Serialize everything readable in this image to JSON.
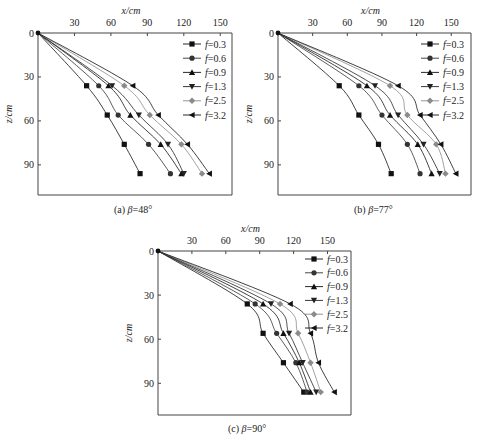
{
  "figure": {
    "panels": [
      {
        "id": "a",
        "caption_prefix": "(a) ",
        "caption_symbol": "β",
        "caption_value": "=48°"
      },
      {
        "id": "b",
        "caption_prefix": "(b) ",
        "caption_symbol": "β",
        "caption_value": "=77°"
      },
      {
        "id": "c",
        "caption_prefix": "(c) ",
        "caption_symbol": "β",
        "caption_value": "=90°"
      }
    ]
  },
  "chart_data": [
    {
      "type": "line",
      "title": "(a) β=48°",
      "xlabel": "x/cm",
      "ylabel": "z/cm",
      "x_ticks": [
        30,
        60,
        90,
        120,
        150
      ],
      "y_ticks": [
        0,
        30,
        60,
        90
      ],
      "xlim": [
        0,
        160
      ],
      "ylim": [
        110,
        0
      ],
      "y_inverted": true,
      "x_axis_position": "top",
      "grid": false,
      "legend_position": "upper right",
      "z": [
        0,
        36,
        56,
        76,
        96
      ],
      "series": [
        {
          "name": "f=0.3",
          "marker": "square",
          "color": "#111111",
          "x": [
            0,
            40,
            57,
            71,
            84
          ]
        },
        {
          "name": "f=0.6",
          "marker": "circle",
          "color": "#333333",
          "x": [
            0,
            50,
            66,
            91,
            109
          ]
        },
        {
          "name": "f=0.9",
          "marker": "triangle-up",
          "color": "#111111",
          "x": [
            0,
            58,
            76,
            101,
            118
          ]
        },
        {
          "name": "f=1.3",
          "marker": "triangle-down",
          "color": "#222222",
          "x": [
            0,
            61,
            83,
            107,
            120
          ]
        },
        {
          "name": "f=2.5",
          "marker": "diamond",
          "color": "#8a8a8a",
          "x": [
            0,
            71,
            92,
            118,
            135
          ]
        },
        {
          "name": "f=3.2",
          "marker": "triangle-left",
          "color": "#111111",
          "x": [
            0,
            78,
            99,
            123,
            141
          ]
        }
      ]
    },
    {
      "type": "line",
      "title": "(b) β=77°",
      "xlabel": "x/cm",
      "ylabel": "z/cm",
      "x_ticks": [
        30,
        60,
        90,
        120,
        150
      ],
      "y_ticks": [
        0,
        30,
        60,
        90
      ],
      "xlim": [
        0,
        168
      ],
      "ylim": [
        110,
        0
      ],
      "y_inverted": true,
      "x_axis_position": "top",
      "grid": false,
      "legend_position": "upper right",
      "z": [
        0,
        36,
        56,
        76,
        96
      ],
      "series": [
        {
          "name": "f=0.3",
          "marker": "square",
          "color": "#111111",
          "x": [
            0,
            53,
            70,
            87,
            98
          ]
        },
        {
          "name": "f=0.6",
          "marker": "circle",
          "color": "#333333",
          "x": [
            0,
            70,
            90,
            112,
            123
          ]
        },
        {
          "name": "f=0.9",
          "marker": "triangle-up",
          "color": "#111111",
          "x": [
            0,
            77,
            97,
            121,
            133
          ]
        },
        {
          "name": "f=1.3",
          "marker": "triangle-down",
          "color": "#222222",
          "x": [
            0,
            84,
            104,
            126,
            140
          ]
        },
        {
          "name": "f=2.5",
          "marker": "diamond",
          "color": "#8a8a8a",
          "x": [
            0,
            97,
            112,
            137,
            145
          ]
        },
        {
          "name": "f=3.2",
          "marker": "triangle-left",
          "color": "#111111",
          "x": [
            0,
            104,
            123,
            141,
            154
          ]
        }
      ]
    },
    {
      "type": "line",
      "title": "(c) β=90°",
      "xlabel": "x/cm",
      "ylabel": "z/cm",
      "x_ticks": [
        30,
        60,
        90,
        120,
        150
      ],
      "y_ticks": [
        0,
        30,
        60,
        90
      ],
      "xlim": [
        0,
        170
      ],
      "ylim": [
        110,
        0
      ],
      "y_inverted": true,
      "x_axis_position": "top",
      "grid": false,
      "legend_position": "upper right",
      "z": [
        0,
        36,
        56,
        76,
        96
      ],
      "series": [
        {
          "name": "f=0.3",
          "marker": "square",
          "color": "#111111",
          "x": [
            0,
            79,
            93,
            111,
            129
          ]
        },
        {
          "name": "f=0.6",
          "marker": "circle",
          "color": "#333333",
          "x": [
            0,
            86,
            105,
            122,
            132
          ]
        },
        {
          "name": "f=0.9",
          "marker": "triangle-up",
          "color": "#111111",
          "x": [
            0,
            93,
            111,
            125,
            135
          ]
        },
        {
          "name": "f=1.3",
          "marker": "triangle-down",
          "color": "#222222",
          "x": [
            0,
            100,
            116,
            128,
            140
          ]
        },
        {
          "name": "f=2.5",
          "marker": "diamond",
          "color": "#8a8a8a",
          "x": [
            0,
            108,
            124,
            135,
            144
          ]
        },
        {
          "name": "f=3.2",
          "marker": "triangle-left",
          "color": "#111111",
          "x": [
            0,
            117,
            135,
            142,
            156
          ]
        }
      ]
    }
  ]
}
